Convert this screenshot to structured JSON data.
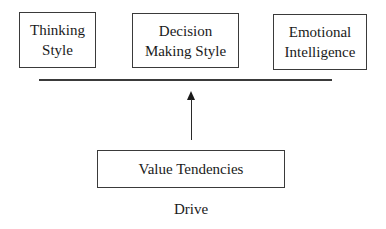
{
  "top_boxes": [
    {
      "line1": "Thinking",
      "line2": "Style"
    },
    {
      "line1": "Decision",
      "line2": "Making Style"
    },
    {
      "line1": "Emotional",
      "line2": "Intelligence"
    }
  ],
  "bottom_box": {
    "label": "Value Tendencies"
  },
  "caption": "Drive"
}
